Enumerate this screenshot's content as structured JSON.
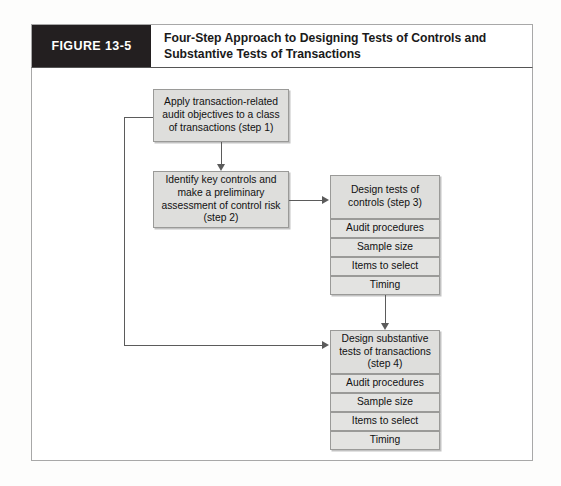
{
  "figure": {
    "tag": "FIGURE 13-5",
    "title": "Four-Step Approach to Designing Tests of Controls and Substantive Tests of Transactions"
  },
  "nodes": {
    "step1": "Apply transaction-related audit objectives to a class of transactions (step 1)",
    "step2": "Identify key controls and make a preliminary assessment of control risk (step 2)",
    "step3": "Design tests of controls (step 3)",
    "step4": "Design substantive tests of transactions (step 4)"
  },
  "controls_attributes": [
    "Audit procedures",
    "Sample size",
    "Items to select",
    "Timing"
  ],
  "substantive_attributes": [
    "Audit procedures",
    "Sample size",
    "Items to select",
    "Timing"
  ],
  "colors": {
    "tag_background": "#231f20",
    "node_fill": "#dededc",
    "sub_node_fill": "#e3e3e1",
    "node_border": "#9a9a98",
    "connector": "#5b5b5b",
    "frame_border": "#a8a8a8"
  }
}
